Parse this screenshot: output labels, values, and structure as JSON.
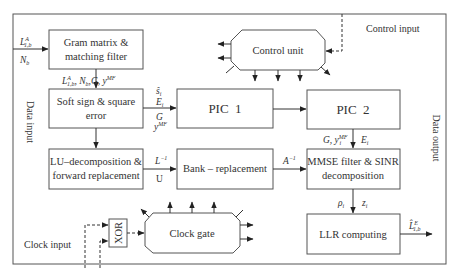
{
  "diagram": {
    "type": "block-diagram",
    "outer_labels": {
      "data_input": "Data input",
      "data_output": "Data output",
      "control_input": "Control input",
      "clock_input": "Clock input"
    },
    "blocks": {
      "gram": {
        "line1": "Gram matrix &",
        "line2": "matching filter"
      },
      "softsign": {
        "line1": "Soft sign & square",
        "line2": "error"
      },
      "lu": {
        "line1": "LU–decomposition &",
        "line2": "forward replacement"
      },
      "pic1": {
        "label": "PIC  1"
      },
      "pic2": {
        "label": "PIC  2"
      },
      "bank": {
        "label": "Bank – replacement"
      },
      "mmse": {
        "line1": "MMSE filter & SINR",
        "line2": "decomposition"
      },
      "llr": {
        "label": "LLR computing"
      },
      "control": {
        "label": "Control unit"
      },
      "clock": {
        "label": "Clock gate"
      },
      "xor": {
        "label": "XOR"
      }
    },
    "signals": {
      "input_L": "L",
      "input_L_sup": "A",
      "input_L_sub": "1,b",
      "input_N": "N",
      "input_N_sub": "b",
      "gram_to_soft": "L^A_{1,b}, N_b, G, y^MF",
      "soft_to_pic1_s": "ŝ",
      "soft_to_pic1_s_sub": "i",
      "soft_to_pic1_E": "E",
      "soft_to_pic1_E_sub": "i",
      "soft_to_pic1_G": "G",
      "soft_to_pic1_y": "y",
      "soft_to_pic1_y_sup": "MF",
      "pic2_to_mmse_left": "G, y",
      "pic2_to_mmse_left_sup": "MF",
      "pic2_to_mmse_left_sub": "i",
      "pic2_to_mmse_right": "E",
      "pic2_to_mmse_right_sub": "i",
      "lu_to_bank_top": "L",
      "lu_to_bank_top_sup": "−1",
      "lu_to_bank_bottom": "U",
      "bank_to_mmse": "A",
      "bank_to_mmse_sup": "−1",
      "mmse_to_llr_left": "ρ",
      "mmse_to_llr_left_sub": "i",
      "mmse_to_llr_right": "z",
      "mmse_to_llr_right_sub": "i",
      "output": "L̂",
      "output_sup": "E",
      "output_sub": "1,b"
    }
  }
}
